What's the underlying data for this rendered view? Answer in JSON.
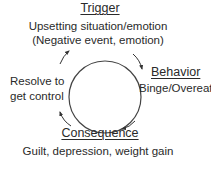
{
  "diagram": {
    "type": "cycle",
    "stages": [
      {
        "id": "trigger",
        "title": "Trigger",
        "lines": [
          "Upsetting situation/emotion",
          "(Negative event, emotion)"
        ]
      },
      {
        "id": "behavior",
        "title": "Behavior",
        "lines": [
          "Binge/Overeat"
        ]
      },
      {
        "id": "consequence",
        "title": "Consequence",
        "lines": [
          "Guilt, depression, weight gain"
        ]
      },
      {
        "id": "resolve",
        "title": "",
        "lines": [
          "Resolve to",
          "get control"
        ]
      }
    ],
    "direction": "clockwise",
    "colors": {
      "stroke": "#333333",
      "text": "#2a2a2a",
      "background": "#ffffff"
    }
  }
}
